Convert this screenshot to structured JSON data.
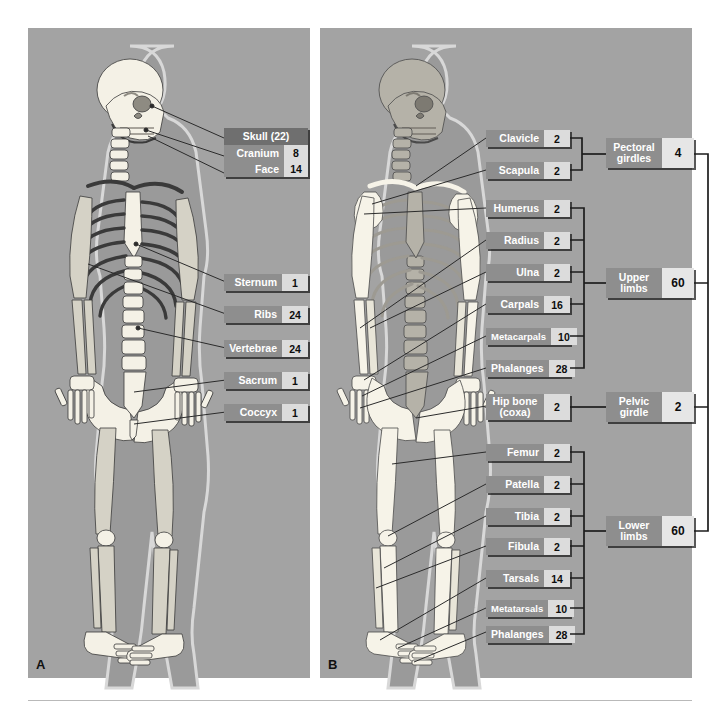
{
  "figure": {
    "panelA": {
      "letter": "A"
    },
    "panelB": {
      "letter": "B"
    }
  },
  "axial": {
    "skull": {
      "header": "Skull (22)",
      "rows": [
        {
          "label": "Cranium",
          "count": "8"
        },
        {
          "label": "Face",
          "count": "14"
        }
      ]
    },
    "labels": [
      {
        "label": "Sternum",
        "count": "1"
      },
      {
        "label": "Ribs",
        "count": "24"
      },
      {
        "label": "Vertebrae",
        "count": "24"
      },
      {
        "label": "Sacrum",
        "count": "1"
      },
      {
        "label": "Coccyx",
        "count": "1"
      }
    ]
  },
  "appendicular": {
    "bones": [
      {
        "label": "Clavicle",
        "count": "2"
      },
      {
        "label": "Scapula",
        "count": "2"
      },
      {
        "label": "Humerus",
        "count": "2"
      },
      {
        "label": "Radius",
        "count": "2"
      },
      {
        "label": "Ulna",
        "count": "2"
      },
      {
        "label": "Carpals",
        "count": "16"
      },
      {
        "label": "Metacarpals",
        "count": "10"
      },
      {
        "label": "Phalanges",
        "count": "28"
      },
      {
        "label": "Hip bone\n(coxa)",
        "count": "2"
      },
      {
        "label": "Femur",
        "count": "2"
      },
      {
        "label": "Patella",
        "count": "2"
      },
      {
        "label": "Tibia",
        "count": "2"
      },
      {
        "label": "Fibula",
        "count": "2"
      },
      {
        "label": "Tarsals",
        "count": "14"
      },
      {
        "label": "Metatarsals",
        "count": "10"
      },
      {
        "label": "Phalanges",
        "count": "28"
      }
    ],
    "groups": [
      {
        "label": "Pectoral\ngirdles",
        "count": "4"
      },
      {
        "label": "Upper\nlimbs",
        "count": "60"
      },
      {
        "label": "Pelvic\ngirdle",
        "count": "2"
      },
      {
        "label": "Lower\nlimbs",
        "count": "60"
      }
    ]
  },
  "colors": {
    "panel_bg": "#a3a3a3",
    "chip_name_bg": "#8e8e8e",
    "chip_num_bg": "#dcdcdc",
    "skull_header_bg": "#6f6f6f",
    "bone_light": "#f2efe4",
    "bone_gray": "#b9b9b9",
    "body_silhouette": "#9a9a9a",
    "leader_line": "#2b2b2b"
  }
}
